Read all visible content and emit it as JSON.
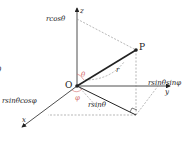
{
  "diagram": {
    "axes": {
      "x": "x",
      "y": "y",
      "z": "z"
    },
    "points": {
      "origin": "O",
      "point": "P"
    },
    "labels": {
      "z_projection": "rcosθ",
      "y_projection": "rsinθsinφ",
      "x_projection": "rsinθcosφ",
      "radius": "r",
      "projected_radius": "rsinθ",
      "polar_angle": "θ",
      "azimuth_angle": "φ",
      "edge_glyph": "θ"
    },
    "colors": {
      "angle": "#d36b6b",
      "line": "#222222",
      "dashed": "#888888"
    }
  }
}
